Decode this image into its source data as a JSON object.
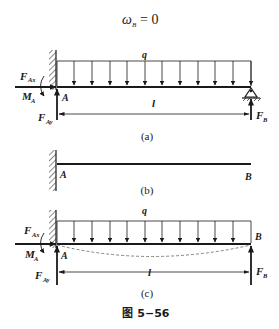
{
  "equation": {
    "lhs": "ω",
    "sub": "B",
    "rhs": "= 0"
  },
  "panel_a": {
    "load_label": "q",
    "force_ax": "F",
    "force_ax_sub": "Ax",
    "moment_a": "M",
    "moment_a_sub": "A",
    "point_a": "A",
    "force_ay": "F",
    "force_ay_sub": "Ay",
    "length_label": "l",
    "force_b": "F",
    "force_b_sub": "B",
    "caption": "(a)"
  },
  "panel_b": {
    "point_a": "A",
    "point_b": "B",
    "caption": "(b)"
  },
  "panel_c": {
    "load_label": "q",
    "force_ax": "F",
    "force_ax_sub": "Ax",
    "moment_a": "M",
    "moment_a_sub": "A",
    "point_a": "A",
    "point_b": "B",
    "force_ay": "F",
    "force_ay_sub": "Ay",
    "length_label": "l",
    "force_b": "F",
    "force_b_sub": "B",
    "caption": "(c)"
  },
  "figure_caption": "图 5−56",
  "colors": {
    "ink": "#1a1a1a",
    "background": "#ffffff",
    "dashed": "#777777"
  }
}
